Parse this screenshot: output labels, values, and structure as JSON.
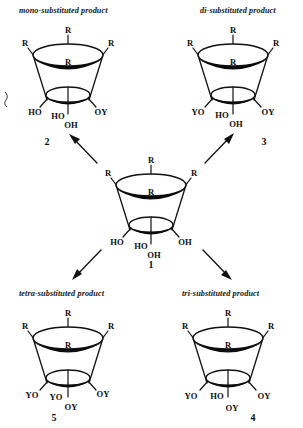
{
  "diagram": {
    "title_visible": false,
    "type": "reaction-scheme",
    "ink_color": "#111111",
    "background_color": "#ffffff"
  },
  "captions": {
    "mono": "mono-substituted  product",
    "di": "di-substituted  product",
    "tetra": "tetra-substituted  product",
    "tri": "tri-substituted  product"
  },
  "compounds": [
    {
      "id": "center",
      "number": "1",
      "upper_rim": [
        "R",
        "R",
        "R",
        "R"
      ],
      "lower_rim_labels": [
        "HO",
        "HO",
        "OH",
        "OH"
      ],
      "lower_left": "HO",
      "lower_inner_left": "HO",
      "lower_inner_right": "OH",
      "lower_right": "OH"
    },
    {
      "id": "mono",
      "number": "2",
      "upper_rim": [
        "R",
        "R",
        "R",
        "R"
      ],
      "lower_rim_labels": [
        "HO",
        "HO",
        "OH",
        "OY"
      ],
      "lower_left": "HO",
      "lower_inner_left": "HO",
      "lower_inner_right": "OH",
      "lower_right": "OY"
    },
    {
      "id": "di",
      "number": "3",
      "upper_rim": [
        "R",
        "R",
        "R",
        "R"
      ],
      "lower_rim_labels": [
        "YO",
        "HO",
        "OH",
        "OY"
      ],
      "lower_left": "YO",
      "lower_inner_left": "HO",
      "lower_inner_right": "OH",
      "lower_right": "OY"
    },
    {
      "id": "tetra",
      "number": "5",
      "upper_rim": [
        "R",
        "R",
        "R",
        "R"
      ],
      "lower_rim_labels": [
        "YO",
        "YO",
        "OY",
        "OY"
      ],
      "lower_left": "YO",
      "lower_inner_left": "YO",
      "lower_inner_right": "OY",
      "lower_right": "OY"
    },
    {
      "id": "tri",
      "number": "4",
      "upper_rim": [
        "R",
        "R",
        "R",
        "R"
      ],
      "lower_rim_labels": [
        "YO",
        "HO",
        "OY",
        "OY"
      ],
      "lower_left": "YO",
      "lower_inner_left": "HO",
      "lower_inner_right": "OY",
      "lower_right": "OY"
    }
  ],
  "arrows": [
    {
      "name": "arrow-to-mono",
      "from": "1",
      "to": "2",
      "direction": "up-left"
    },
    {
      "name": "arrow-to-di",
      "from": "1",
      "to": "3",
      "direction": "up-right"
    },
    {
      "name": "arrow-to-tetra",
      "from": "1",
      "to": "5",
      "direction": "down-left"
    },
    {
      "name": "arrow-to-tri",
      "from": "1",
      "to": "4",
      "direction": "down-right"
    }
  ],
  "substituent_symbols": {
    "R": "R",
    "Y": "Y",
    "O": "O",
    "H": "H"
  }
}
